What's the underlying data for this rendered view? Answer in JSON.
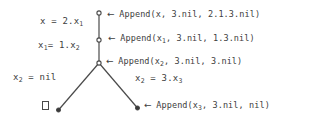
{
  "figure": {
    "type": "derivation-tree",
    "background_color": "#ffffff",
    "ink_color": "#3d3d3d",
    "arrow_glyph": "←",
    "arrow_name": "left-arrow-icon"
  },
  "nodes": [
    {
      "id": "n0",
      "name": "root-node",
      "x": 99,
      "y": 13,
      "style": "open-circle"
    },
    {
      "id": "n1",
      "name": "second-node",
      "x": 99,
      "y": 40,
      "style": "open-circle"
    },
    {
      "id": "n2",
      "name": "branch-node",
      "x": 99,
      "y": 63,
      "style": "open-circle"
    },
    {
      "id": "n3",
      "name": "left-leaf-node",
      "x": 58,
      "y": 110,
      "style": "filled-dot"
    },
    {
      "id": "n4",
      "name": "right-leaf-node",
      "x": 138,
      "y": 108,
      "style": "filled-dot"
    }
  ],
  "edges": [
    {
      "name": "edge-root-to-second",
      "from": "n0",
      "to": "n1"
    },
    {
      "name": "edge-second-to-branch",
      "from": "n1",
      "to": "n2"
    },
    {
      "name": "edge-branch-to-left-leaf",
      "from": "n2",
      "to": "n3"
    },
    {
      "name": "edge-branch-to-right-leaf",
      "from": "n2",
      "to": "n4"
    }
  ],
  "edge_labels": {
    "x_eq": {
      "text": "x = 2.x",
      "sub": "1",
      "full": "x = 2.x₁"
    },
    "x1_eq": {
      "text": "x",
      "sub": "1",
      "rest": "= 1.x",
      "sub2": "2",
      "full": "x₁= 1.x₂"
    },
    "x2_nil": {
      "text": "x",
      "sub": "2",
      "rest": " = nil",
      "full": "x₂ = nil"
    },
    "x2_eq_3x3": {
      "text": "x",
      "sub": "2",
      "rest": " = 3.x",
      "sub2": "3",
      "full": "x₂ = 3.x₃"
    }
  },
  "annotations": [
    {
      "name": "annotation-append-x",
      "arrow": "←",
      "call": "Append(x, 3.nil, 2.1.3.nil)",
      "pre": "Append(x, 3.nil, 2.1.3.nil)",
      "full": "← Append(x, 3.nil, 2.1.3.nil)"
    },
    {
      "name": "annotation-append-x1",
      "arrow": "←",
      "pre": "Append(x",
      "sub": "1",
      "post": ", 3.nil, 1.3.nil)",
      "full": "← Append(x₁, 3.nil, 1.3.nil)"
    },
    {
      "name": "annotation-append-x2",
      "arrow": "←",
      "pre": "Append(x",
      "sub": "2",
      "post": ", 3.nil, 3.nil)",
      "full": "← Append(x₂, 3.nil, 3.nil)"
    },
    {
      "name": "annotation-append-x3",
      "arrow": "←",
      "pre": "Append(x",
      "sub": "3",
      "post": ", 3.nil, nil)",
      "full": "← Append(x₃, 3.nil, nil)"
    }
  ],
  "symbols": {
    "empty_box_name": "empty-clause-box",
    "empty_box_meaning": "□"
  }
}
